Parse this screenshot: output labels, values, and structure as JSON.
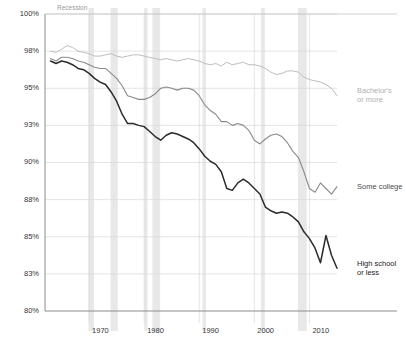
{
  "chart_data": {
    "type": "line",
    "title": "",
    "subtitle": "",
    "xlabel": "",
    "ylabel": "",
    "grid": true,
    "legend_position": "right-inline",
    "annotations": [
      {
        "name": "recession-label",
        "text": "Recession"
      }
    ],
    "y_ticks": [
      "100%",
      "98%",
      "95%",
      "93%",
      "90%",
      "88%",
      "85%",
      "83%",
      "80%"
    ],
    "y_tick_values": [
      100,
      98,
      95,
      93,
      90,
      88,
      85,
      83,
      80
    ],
    "ylim": [
      80,
      100
    ],
    "x_ticks": [
      "1970",
      "1980",
      "1990",
      "2000",
      "2010"
    ],
    "x_tick_values": [
      1970,
      1980,
      1990,
      2000,
      2010
    ],
    "xlim": [
      1962,
      2015
    ],
    "recession_bands": [
      {
        "start": 1969.9,
        "end": 1970.9
      },
      {
        "start": 1973.9,
        "end": 1975.2
      },
      {
        "start": 1980.0,
        "end": 1980.6
      },
      {
        "start": 1981.5,
        "end": 1982.9
      },
      {
        "start": 1990.6,
        "end": 1991.2
      },
      {
        "start": 2001.2,
        "end": 2001.9
      },
      {
        "start": 2007.9,
        "end": 2009.5
      }
    ],
    "series": [
      {
        "name": "Bachelor's or more",
        "color": "#bdbdbd",
        "label_color": "#b0b0b0",
        "label_lines": [
          "Bachelor's",
          "or more"
        ],
        "x": [
          1963,
          1964,
          1965,
          1966,
          1967,
          1968,
          1969,
          1970,
          1971,
          1972,
          1973,
          1974,
          1975,
          1976,
          1977,
          1978,
          1979,
          1980,
          1981,
          1982,
          1983,
          1984,
          1985,
          1986,
          1987,
          1988,
          1989,
          1990,
          1991,
          1992,
          1993,
          1994,
          1995,
          1996,
          1997,
          1998,
          1999,
          2000,
          2001,
          2002,
          2003,
          2004,
          2005,
          2006,
          2007,
          2008,
          2009,
          2010,
          2011,
          2012,
          2013,
          2014,
          2015
        ],
        "values": [
          98.0,
          97.9,
          98.1,
          98.3,
          98.2,
          98.0,
          97.9,
          97.8,
          97.6,
          97.6,
          97.7,
          97.8,
          97.6,
          97.5,
          97.6,
          97.7,
          97.7,
          97.6,
          97.5,
          97.4,
          97.3,
          97.4,
          97.3,
          97.2,
          97.3,
          97.4,
          97.3,
          97.2,
          97.0,
          96.9,
          97.0,
          96.8,
          97.1,
          96.9,
          97.0,
          97.1,
          96.9,
          96.9,
          96.8,
          96.6,
          96.3,
          96.1,
          96.2,
          96.4,
          96.4,
          96.3,
          95.9,
          95.7,
          95.6,
          95.5,
          95.3,
          95.0,
          94.6
        ]
      },
      {
        "name": "Some college",
        "color": "#8a8a8a",
        "label_color": "#4d4d4d",
        "label_lines": [
          "Some college"
        ],
        "x": [
          1963,
          1964,
          1965,
          1966,
          1967,
          1968,
          1969,
          1970,
          1971,
          1972,
          1973,
          1974,
          1975,
          1976,
          1977,
          1978,
          1979,
          1980,
          1981,
          1982,
          1983,
          1984,
          1985,
          1986,
          1987,
          1988,
          1989,
          1990,
          1991,
          1992,
          1993,
          1994,
          1995,
          1996,
          1997,
          1998,
          1999,
          2000,
          2001,
          2002,
          2003,
          2004,
          2005,
          2006,
          2007,
          2008,
          2009,
          2010,
          2011,
          2012,
          2013,
          2014,
          2015
        ],
        "values": [
          97.4,
          97.2,
          97.5,
          97.5,
          97.4,
          97.2,
          97.1,
          96.9,
          96.7,
          96.6,
          96.6,
          96.2,
          95.8,
          95.2,
          94.6,
          94.5,
          94.4,
          94.4,
          94.5,
          94.7,
          95.0,
          95.1,
          95.0,
          94.9,
          95.0,
          95.0,
          94.9,
          94.6,
          94.1,
          93.8,
          93.6,
          93.2,
          93.2,
          93.0,
          93.1,
          93.0,
          92.6,
          91.8,
          91.5,
          91.9,
          92.2,
          92.3,
          92.1,
          91.6,
          90.9,
          90.4,
          89.5,
          88.6,
          88.4,
          88.9,
          88.6,
          88.3,
          88.7
        ]
      },
      {
        "name": "High school or less",
        "color": "#2b2b2b",
        "label_color": "#1a1a1a",
        "label_lines": [
          "High school",
          "or less"
        ],
        "x": [
          1963,
          1964,
          1965,
          1966,
          1967,
          1968,
          1969,
          1970,
          1971,
          1972,
          1973,
          1974,
          1975,
          1976,
          1977,
          1978,
          1979,
          1980,
          1981,
          1982,
          1983,
          1984,
          1985,
          1986,
          1987,
          1988,
          1989,
          1990,
          1991,
          1992,
          1993,
          1994,
          1995,
          1996,
          1997,
          1998,
          1999,
          2000,
          2001,
          2002,
          2003,
          2004,
          2005,
          2006,
          2007,
          2008,
          2009,
          2010,
          2011,
          2012,
          2013,
          2014,
          2015
        ],
        "values": [
          97.2,
          97.0,
          97.2,
          97.1,
          96.9,
          96.6,
          96.5,
          96.2,
          95.8,
          95.5,
          95.3,
          94.8,
          94.3,
          93.6,
          93.1,
          93.1,
          93.0,
          92.9,
          92.5,
          92.1,
          91.8,
          92.2,
          92.4,
          92.3,
          92.1,
          91.9,
          91.6,
          91.1,
          90.5,
          90.1,
          89.9,
          89.5,
          88.6,
          88.5,
          88.9,
          89.1,
          88.9,
          88.6,
          88.3,
          87.4,
          87.1,
          86.9,
          87.0,
          86.9,
          86.6,
          86.2,
          85.4,
          84.9,
          84.4,
          83.6,
          85.1,
          84.0,
          83.3
        ]
      }
    ]
  }
}
